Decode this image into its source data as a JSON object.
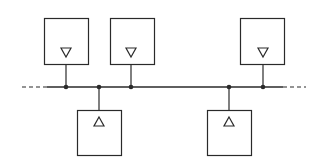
{
  "diagram": {
    "type": "bus-topology",
    "colors": {
      "stroke": "#2a2a2a",
      "background": "#ffffff"
    },
    "bus": {
      "y": 87,
      "solid_x1": 47,
      "solid_x2": 283,
      "dash_left_x1": 22,
      "dash_right_x2": 306
    },
    "top_nodes": [
      {
        "id": "top-1",
        "box_x": 44,
        "box_y": 18,
        "w": 44,
        "h": 46,
        "tap_x": 66,
        "symbol": "triangle-down"
      },
      {
        "id": "top-2",
        "box_x": 110,
        "box_y": 18,
        "w": 44,
        "h": 46,
        "tap_x": 131,
        "symbol": "triangle-down"
      },
      {
        "id": "top-3",
        "box_x": 240,
        "box_y": 18,
        "w": 44,
        "h": 46,
        "tap_x": 263,
        "symbol": "triangle-down"
      }
    ],
    "bottom_nodes": [
      {
        "id": "bottom-1",
        "box_x": 77,
        "box_y": 110,
        "w": 44,
        "h": 45,
        "tap_x": 99,
        "symbol": "triangle-up"
      },
      {
        "id": "bottom-2",
        "box_x": 207,
        "box_y": 110,
        "w": 44,
        "h": 45,
        "tap_x": 229,
        "symbol": "triangle-up"
      }
    ]
  }
}
